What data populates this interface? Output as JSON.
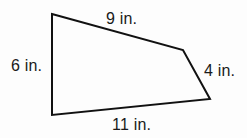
{
  "figure": {
    "type": "quadrilateral",
    "stroke_color": "#111111",
    "stroke_width": 2,
    "background_color": "#fdfdfd",
    "text_color": "#1a1a1a",
    "unit": "in.",
    "vertices": [
      {
        "name": "top-left",
        "x": 52,
        "y": 14
      },
      {
        "name": "right-bend",
        "x": 183,
        "y": 50
      },
      {
        "name": "bottom-right",
        "x": 210,
        "y": 99
      },
      {
        "name": "bottom-left",
        "x": 52,
        "y": 115
      }
    ],
    "sides": [
      {
        "name": "top",
        "label": "9 in.",
        "length": 9,
        "from": "top-left",
        "to": "right-bend"
      },
      {
        "name": "right",
        "label": "4 in.",
        "length": 4,
        "from": "right-bend",
        "to": "bottom-right"
      },
      {
        "name": "bottom",
        "label": "11 in.",
        "length": 11,
        "from": "bottom-right",
        "to": "bottom-left"
      },
      {
        "name": "left",
        "label": "6 in.",
        "length": 6,
        "from": "bottom-left",
        "to": "top-left"
      }
    ]
  }
}
